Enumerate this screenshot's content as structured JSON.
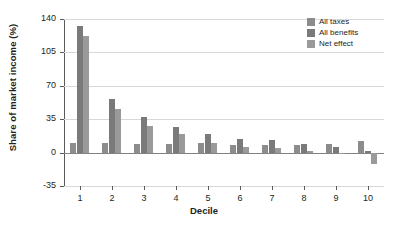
{
  "chart_data": {
    "type": "bar",
    "title": "",
    "xlabel": "Decile",
    "ylabel": "Share of market income (%)",
    "categories": [
      "1",
      "2",
      "3",
      "4",
      "5",
      "6",
      "7",
      "8",
      "9",
      "10"
    ],
    "ylim": [
      -35,
      140
    ],
    "yticks": [
      140,
      105,
      70,
      35,
      0,
      -35
    ],
    "grid": true,
    "legend_position": "top-right",
    "series": [
      {
        "name": "All taxes",
        "color": "#8c8c8c",
        "values": [
          10,
          10,
          9,
          9,
          10,
          8,
          8,
          8,
          9,
          12
        ]
      },
      {
        "name": "All benefits",
        "color": "#7a7a7a",
        "values": [
          133,
          56,
          37,
          27,
          19,
          14,
          13,
          9,
          6,
          2
        ]
      },
      {
        "name": "Net effect",
        "color": "#9a9a9a",
        "values": [
          122,
          46,
          28,
          19,
          10,
          6,
          5,
          2,
          -1,
          -12
        ]
      }
    ]
  },
  "legend": {
    "items": [
      {
        "label": "All taxes"
      },
      {
        "label": "All benefits"
      },
      {
        "label": "Net effect"
      }
    ]
  }
}
